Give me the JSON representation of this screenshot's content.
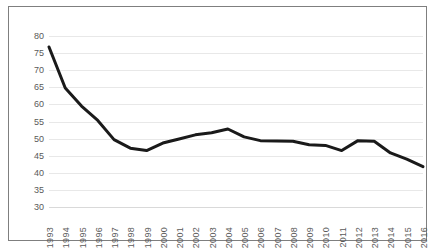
{
  "chart_data": {
    "type": "line",
    "title": "",
    "subtitle": "",
    "xlabel": "",
    "ylabel": "",
    "categories": [
      "1993",
      "1994",
      "1995",
      "1996",
      "1997",
      "1998",
      "1999",
      "2000",
      "2001",
      "2002",
      "2003",
      "2004",
      "2005",
      "2006",
      "2007",
      "2008",
      "2009",
      "2010",
      "2011",
      "2012",
      "2013",
      "2014",
      "2015",
      "2016"
    ],
    "values": [
      76.8,
      64.8,
      59.5,
      55.3,
      49.7,
      47.2,
      46.5,
      48.7,
      49.9,
      51.1,
      51.7,
      52.8,
      50.5,
      49.4,
      49.3,
      49.2,
      48.2,
      48.0,
      46.5,
      49.4,
      49.2,
      45.8,
      44.0,
      41.8
    ],
    "series": [
      {
        "name": "",
        "values": [
          76.8,
          64.8,
          59.5,
          55.3,
          49.7,
          47.2,
          46.5,
          48.7,
          49.9,
          51.1,
          51.7,
          52.8,
          50.5,
          49.4,
          49.3,
          49.2,
          48.2,
          48.0,
          46.5,
          49.4,
          49.2,
          45.8,
          44.0,
          41.8
        ],
        "color": "#1a1a1a"
      }
    ],
    "ylim": [
      30,
      80
    ],
    "yticks": [
      30,
      35,
      40,
      45,
      50,
      55,
      60,
      65,
      70,
      75,
      80
    ],
    "ytick_labels": [
      "30",
      "35",
      "40",
      "45",
      "50",
      "55",
      "60",
      "65",
      "70",
      "75",
      "80"
    ],
    "xtick_labels": [
      "1993",
      "1994",
      "1995",
      "1996",
      "1997",
      "1998",
      "1999",
      "2000",
      "2001",
      "2002",
      "2003",
      "2004",
      "2005",
      "2006",
      "2007",
      "2008",
      "2009",
      "2010",
      "2011",
      "2012",
      "2013",
      "2014",
      "2015",
      "2016"
    ],
    "grid": {
      "horizontal": true,
      "vertical": false,
      "color": "#e8e8e8"
    },
    "legend": {
      "visible": false,
      "position": "none"
    },
    "annotations": [],
    "colors": {
      "line": "#1a1a1a",
      "frame_border": "#7f7f7f",
      "grid": "#e8e8e8",
      "tick_label": "#5a5a5a",
      "background": "#ffffff"
    },
    "style": {
      "line_width_px": 3,
      "x_label_rotation_deg": 90
    }
  }
}
